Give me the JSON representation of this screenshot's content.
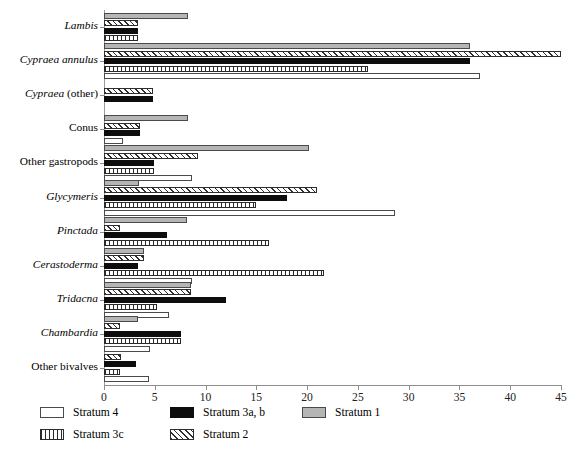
{
  "chart_data": {
    "type": "bar",
    "orientation": "horizontal",
    "title": "",
    "xlabel": "",
    "ylabel": "",
    "xlim": [
      0,
      45
    ],
    "xticks": [
      0,
      5,
      10,
      15,
      20,
      25,
      30,
      35,
      40,
      45
    ],
    "grid": false,
    "legend_position": "bottom-left",
    "categories": [
      "Lambis",
      "Cypraea annulus",
      "Cypraea (other)",
      "Conus",
      "Other gastropods",
      "Glycymeris",
      "Pinctada",
      "Cerastoderma",
      "Tridacna",
      "Chambardia",
      "Other bivalves"
    ],
    "series": [
      {
        "name": "Stratum 1",
        "key": "s1",
        "color": "#b5b5b5",
        "fill": "solid-gray",
        "values": [
          8.3,
          36.0,
          0,
          8.3,
          20.2,
          3.4,
          8.2,
          3.9,
          8.6,
          3.3,
          0
        ]
      },
      {
        "name": "Stratum 2",
        "key": "s2",
        "color": "#ffffff",
        "fill": "diagonal-hatch",
        "values": [
          3.3,
          45.0,
          4.8,
          3.5,
          9.3,
          21.0,
          1.6,
          3.9,
          8.6,
          1.6,
          1.7
        ]
      },
      {
        "name": "Stratum 3a, b",
        "key": "s3ab",
        "color": "#0d0d0d",
        "fill": "solid-black",
        "values": [
          3.3,
          36.0,
          4.8,
          3.5,
          4.9,
          18.0,
          6.2,
          3.3,
          12.0,
          7.6,
          3.2
        ]
      },
      {
        "name": "Stratum 3c",
        "key": "s3c",
        "color": "#ffffff",
        "fill": "vertical-hatch",
        "values": [
          3.3,
          26.0,
          0,
          0,
          4.9,
          15.0,
          16.2,
          21.7,
          5.2,
          7.6,
          1.6
        ]
      },
      {
        "name": "Stratum 4",
        "key": "s4",
        "color": "#ffffff",
        "fill": "empty-white",
        "values": [
          0,
          37.0,
          0,
          1.9,
          8.7,
          28.7,
          0,
          8.7,
          6.4,
          4.5,
          4.4
        ]
      }
    ]
  },
  "legend": {
    "entries": [
      {
        "label": "Stratum 4",
        "key": "s4"
      },
      {
        "label": "Stratum 3a, b",
        "key": "s3ab"
      },
      {
        "label": "Stratum 1",
        "key": "s1"
      },
      {
        "label": "Stratum 3c",
        "key": "s3c"
      },
      {
        "label": "Stratum 2",
        "key": "s2"
      }
    ]
  },
  "axis": {
    "tick_labels": [
      "0",
      "5",
      "10",
      "15",
      "20",
      "25",
      "30",
      "35",
      "40",
      "45"
    ]
  },
  "caption": {
    "text": ""
  }
}
